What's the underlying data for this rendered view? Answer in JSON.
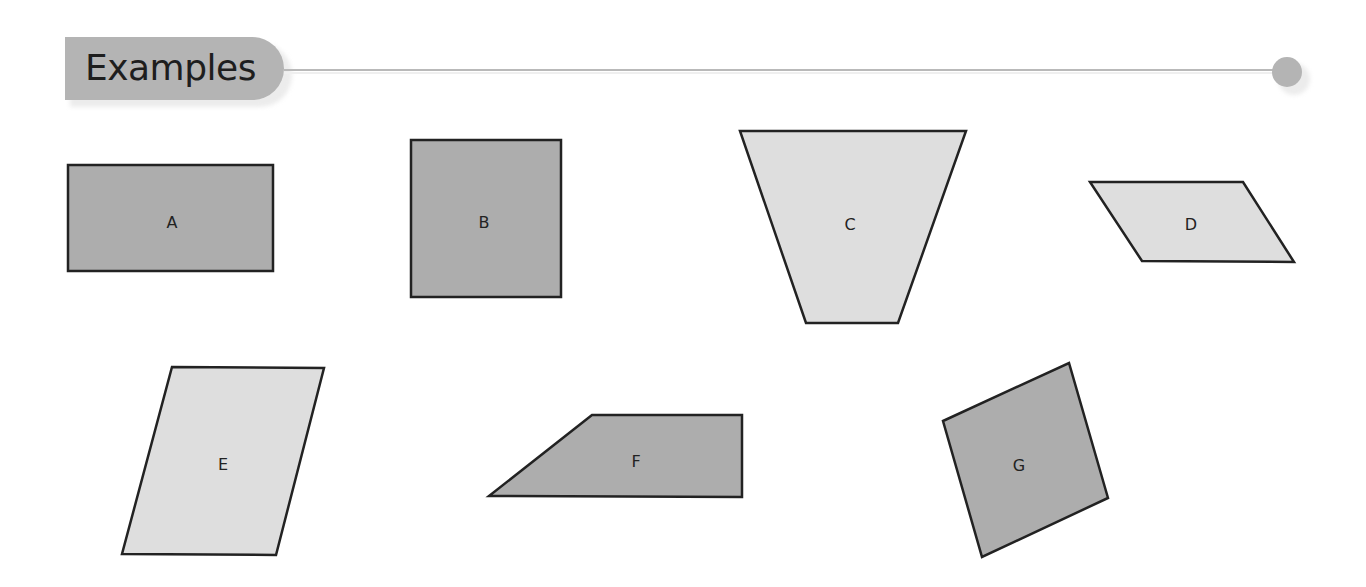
{
  "header": {
    "title": "Examples"
  },
  "colors": {
    "dark_fill": "#adadad",
    "light_fill": "#dedede",
    "stroke": "#222222",
    "header_fill": "#b4b4b4"
  },
  "shapes": [
    {
      "label": "A",
      "kind": "rectangle",
      "fill": "dark",
      "points": "68,165 273,165 273,271 68,271",
      "label_x": 172,
      "label_y": 223
    },
    {
      "label": "B",
      "kind": "square",
      "fill": "dark",
      "points": "411,140 561,140 561,297 411,297",
      "label_x": 484,
      "label_y": 223
    },
    {
      "label": "C",
      "kind": "trapezoid",
      "fill": "light",
      "points": "740,131 966,131 898,323 806,323",
      "label_x": 850,
      "label_y": 225
    },
    {
      "label": "D",
      "kind": "parallelogram",
      "fill": "light",
      "points": "1090,182 1243,182 1294,262 1142,261",
      "label_x": 1191,
      "label_y": 225
    },
    {
      "label": "E",
      "kind": "parallelogram",
      "fill": "light",
      "points": "172,367 324,368 276,555 122,554",
      "label_x": 223,
      "label_y": 465
    },
    {
      "label": "F",
      "kind": "trapezoid",
      "fill": "dark",
      "points": "592,415 742,415 742,497 489,496",
      "label_x": 636,
      "label_y": 462
    },
    {
      "label": "G",
      "kind": "rhombus",
      "fill": "dark",
      "points": "943,421 1069,363 1108,498 982,557",
      "label_x": 1019,
      "label_y": 466
    }
  ]
}
